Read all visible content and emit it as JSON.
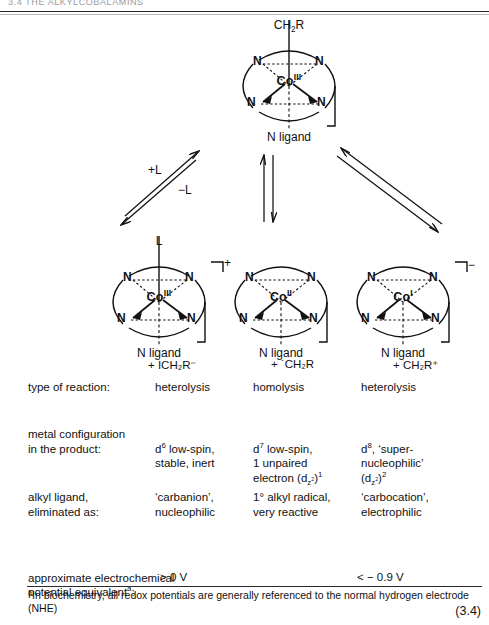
{
  "header": {
    "running_head": "3.4  THE ALKYLCOBALAMINS"
  },
  "scheme": {
    "parent": {
      "axial_top": "CH2R",
      "axial_bottom": "N ligand",
      "metal": "Co",
      "oxidation": "III",
      "nitrogen": "N",
      "charge": ""
    },
    "arrows": {
      "left_forward": "+L",
      "left_reverse": "−L",
      "middle": "",
      "right": ""
    },
    "products": [
      {
        "axial_top": "L",
        "axial_bottom": "N ligand",
        "metal": "Co",
        "oxidation": "III",
        "nitrogen": "N",
        "charge": "+",
        "leaving_group": "+ ICH₂R⁻"
      },
      {
        "axial_top": "",
        "axial_bottom": "N ligand",
        "metal": "Co",
        "oxidation": "II",
        "nitrogen": "N",
        "charge": "",
        "leaving_group": "+ ˙CH₂R"
      },
      {
        "axial_top": "",
        "axial_bottom": "N ligand",
        "metal": "Co",
        "oxidation": "I",
        "nitrogen": "N",
        "charge": "−",
        "leaving_group": "+ CH₂R⁺"
      }
    ]
  },
  "table": {
    "rows": [
      {
        "label": "type of reaction:",
        "values": [
          "heterolysis",
          "homolysis",
          "heterolysis"
        ]
      },
      {
        "label": "metal configuration\nin the product:",
        "values": [
          "d⁶ low-spin,\nstable, inert",
          "d⁷ low-spin,\n1 unpaired\nelectron (d_z²)¹",
          "d⁸, ‘super-\nnucleophilic’\n(d_z²)²"
        ]
      },
      {
        "label": "alkyl ligand,\neliminated as:",
        "values": [
          "‘carbanion’,\nnucleophilic",
          "1° alkyl radical,\nvery reactive",
          "‘carbocation’,\nelectrophilic"
        ]
      },
      {
        "label": "approximate electrochemical\npotential equivalentᵃ:",
        "values": [
          "> 0 V",
          "",
          "< − 0.9 V"
        ]
      }
    ]
  },
  "footnote": {
    "marker": "a",
    "text": "In biochemistry, all redox potentials are generally\nreferenced to the normal hydrogen electrode (NHE)"
  },
  "equation_number": "(3.4)",
  "colors": {
    "ink": "#111111",
    "rule": "#2a2a2a",
    "faint": "#9a9a9a"
  }
}
